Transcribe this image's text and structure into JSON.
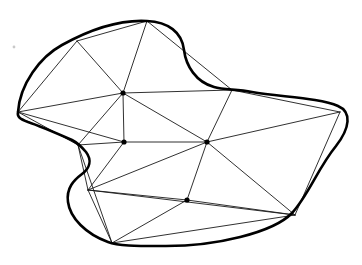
{
  "figure": {
    "kind": "geometry-diagram",
    "canvas": {
      "width": 362,
      "height": 265,
      "background": "#ffffff"
    },
    "style": {
      "boundary_color": "#000000",
      "boundary_width": 2.6,
      "edge_color": "#1a1a1a",
      "edge_width": 0.9,
      "node_color": "#000000",
      "node_radius": 2.6
    },
    "boundary": {
      "name": "region-outline",
      "closed": true,
      "smooth": true,
      "description": "Smooth closed curve with a concave notch on the upper right of the top lobe and a concave notch on the left flank",
      "path": "M 18 112 C 20 84 40 57 62 45 C 80 35 112 19 147 21 C 168 22 182 32 184 50 C 186 66 196 82 214 87 C 224 90 236 89 252 92 C 282 97 320 98 338 106 C 352 112 350 128 336 146 C 318 168 308 196 292 213 C 274 232 216 247 160 246 C 136 246 118 246 108 242 C 86 234 70 218 68 202 C 66 188 74 180 82 174 C 90 168 92 160 86 152 C 80 145 76 142 72 140 C 56 133 40 126 28 122 C 20 119 17 117 18 112 Z",
      "vertices": [
        {
          "id": "B1",
          "label": "leftmost",
          "x": 18,
          "y": 112
        },
        {
          "id": "B2",
          "label": "upper-left",
          "x": 77,
          "y": 41
        },
        {
          "id": "B3",
          "label": "top",
          "x": 147,
          "y": 21
        },
        {
          "id": "B4",
          "label": "notch-right",
          "x": 232,
          "y": 90
        },
        {
          "id": "B5",
          "label": "rightmost",
          "x": 340,
          "y": 112
        },
        {
          "id": "B6",
          "label": "bottom-right",
          "x": 295,
          "y": 215
        },
        {
          "id": "B7",
          "label": "bottom",
          "x": 112,
          "y": 243
        },
        {
          "id": "B8",
          "label": "left-notch-lower",
          "x": 88,
          "y": 190
        },
        {
          "id": "B9",
          "label": "left-notch-upper",
          "x": 78,
          "y": 145
        }
      ]
    },
    "interior_vertices": [
      {
        "id": "I1",
        "label": "hub-upper",
        "x": 123,
        "y": 93
      },
      {
        "id": "I2",
        "label": "hub-left-mid",
        "x": 124,
        "y": 142
      },
      {
        "id": "I3",
        "label": "hub-right-mid",
        "x": 207,
        "y": 142
      },
      {
        "id": "I4",
        "label": "hub-lower",
        "x": 187,
        "y": 200
      }
    ],
    "edges": [
      {
        "from": "B1",
        "to": "B2",
        "x1": 18,
        "y1": 112,
        "x2": 77,
        "y2": 41
      },
      {
        "from": "B2",
        "to": "B3",
        "x1": 77,
        "y1": 41,
        "x2": 147,
        "y2": 21
      },
      {
        "from": "B1",
        "to": "I1",
        "x1": 18,
        "y1": 112,
        "x2": 123,
        "y2": 93
      },
      {
        "from": "B2",
        "to": "I1",
        "x1": 77,
        "y1": 41,
        "x2": 123,
        "y2": 93
      },
      {
        "from": "B3",
        "to": "I1",
        "x1": 147,
        "y1": 21,
        "x2": 123,
        "y2": 93
      },
      {
        "from": "B3",
        "to": "B4",
        "x1": 147,
        "y1": 21,
        "x2": 232,
        "y2": 90
      },
      {
        "from": "B4",
        "to": "B5",
        "x1": 232,
        "y1": 90,
        "x2": 340,
        "y2": 112
      },
      {
        "from": "I1",
        "to": "B4",
        "x1": 123,
        "y1": 93,
        "x2": 232,
        "y2": 90
      },
      {
        "from": "I1",
        "to": "B9",
        "x1": 123,
        "y1": 93,
        "x2": 78,
        "y2": 145
      },
      {
        "from": "B1",
        "to": "B9",
        "x1": 18,
        "y1": 112,
        "x2": 78,
        "y2": 145
      },
      {
        "from": "B1",
        "to": "I2",
        "x1": 18,
        "y1": 112,
        "x2": 124,
        "y2": 142
      },
      {
        "from": "I1",
        "to": "I2",
        "x1": 123,
        "y1": 93,
        "x2": 124,
        "y2": 142
      },
      {
        "from": "I1",
        "to": "I3",
        "x1": 123,
        "y1": 93,
        "x2": 207,
        "y2": 142
      },
      {
        "from": "I2",
        "to": "I3",
        "x1": 124,
        "y1": 142,
        "x2": 207,
        "y2": 142
      },
      {
        "from": "B4",
        "to": "I3",
        "x1": 232,
        "y1": 90,
        "x2": 207,
        "y2": 142
      },
      {
        "from": "B5",
        "to": "I3",
        "x1": 340,
        "y1": 112,
        "x2": 207,
        "y2": 142
      },
      {
        "from": "B9",
        "to": "I2",
        "x1": 78,
        "y1": 145,
        "x2": 124,
        "y2": 142
      },
      {
        "from": "B9",
        "to": "B8",
        "x1": 78,
        "y1": 145,
        "x2": 88,
        "y2": 190
      },
      {
        "from": "B9",
        "to": "B7",
        "x1": 78,
        "y1": 145,
        "x2": 112,
        "y2": 243
      },
      {
        "from": "I2",
        "to": "B8",
        "x1": 124,
        "y1": 142,
        "x2": 88,
        "y2": 190
      },
      {
        "from": "B8",
        "to": "I3",
        "x1": 88,
        "y1": 190,
        "x2": 207,
        "y2": 142
      },
      {
        "from": "B8",
        "to": "I4",
        "x1": 88,
        "y1": 190,
        "x2": 187,
        "y2": 200
      },
      {
        "from": "B8",
        "to": "B7",
        "x1": 88,
        "y1": 190,
        "x2": 112,
        "y2": 243
      },
      {
        "from": "B8",
        "to": "B6",
        "x1": 88,
        "y1": 190,
        "x2": 295,
        "y2": 215
      },
      {
        "from": "I3",
        "to": "I4",
        "x1": 207,
        "y1": 142,
        "x2": 187,
        "y2": 200
      },
      {
        "from": "I3",
        "to": "B6",
        "x1": 207,
        "y1": 142,
        "x2": 295,
        "y2": 215
      },
      {
        "from": "B5",
        "to": "B6",
        "x1": 340,
        "y1": 112,
        "x2": 295,
        "y2": 215
      },
      {
        "from": "I4",
        "to": "B6",
        "x1": 187,
        "y1": 200,
        "x2": 295,
        "y2": 215
      },
      {
        "from": "I4",
        "to": "B7",
        "x1": 187,
        "y1": 200,
        "x2": 112,
        "y2": 243
      },
      {
        "from": "B7",
        "to": "B6",
        "x1": 112,
        "y1": 243,
        "x2": 295,
        "y2": 215
      }
    ],
    "specks": [
      {
        "x": 14,
        "y": 47,
        "r": 1.4
      }
    ]
  }
}
